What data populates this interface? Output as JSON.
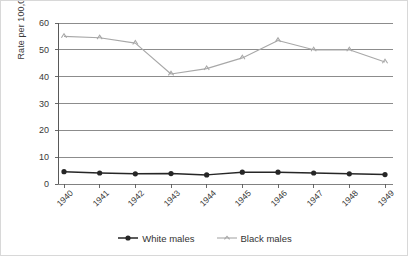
{
  "chart_data": {
    "type": "line",
    "title": "",
    "xlabel": "",
    "ylabel": "Rate per 100,000",
    "categories": [
      "1940",
      "1941",
      "1942",
      "1943",
      "1944",
      "1945",
      "1946",
      "1947",
      "1948",
      "1949"
    ],
    "x": [
      1940,
      1941,
      1942,
      1943,
      1944,
      1945,
      1946,
      1947,
      1948,
      1949
    ],
    "ylim": [
      0,
      60
    ],
    "yticks": [
      0,
      10,
      20,
      30,
      40,
      50,
      60
    ],
    "ytick_labels": [
      "0",
      "10",
      "20",
      "30",
      "40",
      "50",
      "60"
    ],
    "grid": "horizontal",
    "legend_position": "bottom-center",
    "series": [
      {
        "name": "White males",
        "color": "#262626",
        "marker": "circle",
        "values": [
          4.6,
          4.1,
          3.8,
          3.9,
          3.4,
          4.4,
          4.4,
          4.1,
          3.8,
          3.5
        ]
      },
      {
        "name": "Black males",
        "color": "#a8a8a8",
        "marker": "tick",
        "values": [
          55.0,
          54.5,
          52.5,
          41.0,
          43.0,
          47.0,
          53.5,
          50.0,
          50.0,
          45.5
        ]
      }
    ]
  },
  "legend": {
    "items": [
      {
        "label": "White males"
      },
      {
        "label": "Black males"
      }
    ]
  },
  "colors": {
    "white_males": "#262626",
    "black_males": "#a8a8a8",
    "gridline": "#808080",
    "axis": "#595959",
    "text": "#3a3a3a",
    "background": "#ffffff",
    "border": "#d8d8d8"
  }
}
